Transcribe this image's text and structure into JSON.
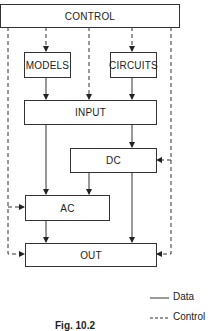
{
  "diagram": {
    "nodes": {
      "control": "CONTROL",
      "models": "MODELS",
      "circuits": "CIRCUITS",
      "input": "INPUT",
      "dc": "DC",
      "ac": "AC",
      "out": "OUT"
    },
    "edges": [
      {
        "from": "control",
        "to": "models",
        "type": "control"
      },
      {
        "from": "control",
        "to": "circuits",
        "type": "control"
      },
      {
        "from": "control",
        "to": "input",
        "type": "control"
      },
      {
        "from": "control",
        "to": "ac",
        "type": "control"
      },
      {
        "from": "control",
        "to": "out",
        "type": "control"
      },
      {
        "from": "control",
        "to": "dc",
        "type": "control"
      },
      {
        "from": "models",
        "to": "input",
        "type": "data"
      },
      {
        "from": "circuits",
        "to": "input",
        "type": "data"
      },
      {
        "from": "input",
        "to": "dc",
        "type": "data"
      },
      {
        "from": "input",
        "to": "ac",
        "type": "data"
      },
      {
        "from": "dc",
        "to": "ac",
        "type": "data"
      },
      {
        "from": "dc",
        "to": "out",
        "type": "data"
      },
      {
        "from": "ac",
        "to": "out",
        "type": "data"
      }
    ]
  },
  "legend": {
    "data_label": "Data",
    "control_label": "Control"
  },
  "caption": "Fig. 10.2"
}
